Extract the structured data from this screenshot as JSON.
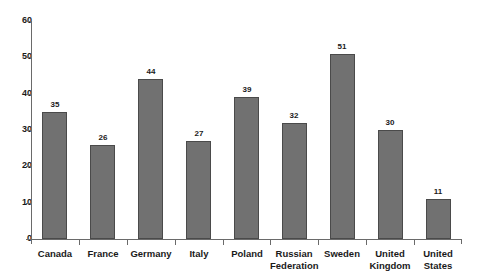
{
  "chart_data": {
    "type": "bar",
    "title": "",
    "subtitle": "",
    "xlabel": "",
    "ylabel": "",
    "categories": [
      "Canada",
      "France",
      "Germany",
      "Italy",
      "Poland",
      "Russian Federation",
      "Sweden",
      "United Kingdom",
      "United States"
    ],
    "values": [
      35,
      26,
      44,
      27,
      39,
      32,
      51,
      30,
      11
    ],
    "data_labels": [
      "35",
      "26",
      "44",
      "27",
      "39",
      "32",
      "51",
      "30",
      "11"
    ],
    "ylim": [
      0,
      60
    ],
    "ytick_labels": [
      "0",
      "10",
      "20",
      "30",
      "40",
      "50",
      "60"
    ],
    "ytick_values": [
      0,
      10,
      20,
      30,
      40,
      50,
      60
    ],
    "grid": false,
    "legend": false,
    "legend_position": "none",
    "bar_color": "#717171",
    "bar_border_color": "#4a4a4a",
    "axis_color": "#6a6a6a",
    "background_color": "#ffffff",
    "text_color": "#1a1a1a"
  }
}
